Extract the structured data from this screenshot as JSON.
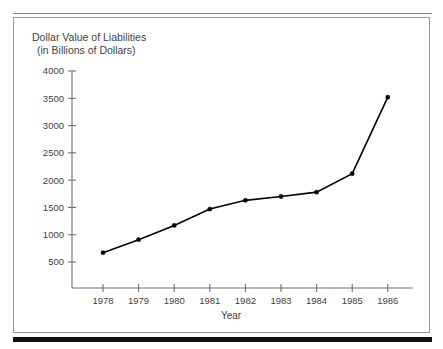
{
  "figure": {
    "background_color": "#ffffff",
    "frame_color": "#9a9a9a",
    "rule_color": "#8a8a8a",
    "bottom_bar_color": "#111111",
    "title_line1": "Dollar Value of Liabilities",
    "title_line2": "(in Billions of Dollars)"
  },
  "chart_data": {
    "type": "line",
    "title": "Dollar Value of Liabilities (in Billions of Dollars)",
    "title_lines": [
      "Dollar Value of Liabilities",
      "(in Billions of Dollars)"
    ],
    "xlabel": "Year",
    "ylabel": "Dollar Value of Liabilities (in Billions of Dollars)",
    "categories": [
      "1978",
      "1979",
      "1980",
      "1981",
      "1982",
      "1983",
      "1984",
      "1985",
      "1986"
    ],
    "x": [
      1978,
      1979,
      1980,
      1981,
      1982,
      1983,
      1984,
      1985,
      1986
    ],
    "values": [
      670,
      910,
      1170,
      1470,
      1630,
      1700,
      1780,
      2120,
      3520
    ],
    "series": [
      {
        "name": "Dollar Value of Liabilities",
        "color": "#000000",
        "marker": "filled-square",
        "values": [
          670,
          910,
          1170,
          1470,
          1630,
          1700,
          1780,
          2120,
          3520
        ]
      }
    ],
    "yticks": [
      500,
      1000,
      1500,
      2000,
      2500,
      3000,
      3500,
      4000
    ],
    "ytick_labels": [
      "500",
      "1000",
      "1500",
      "2000",
      "2500",
      "3000",
      "3500",
      "4000"
    ],
    "xtick_labels": [
      "1978",
      "1979",
      "1980",
      "1981",
      "1982",
      "1983",
      "1984",
      "1985",
      "1986"
    ],
    "ylim": [
      0,
      4000
    ],
    "xlim": [
      1977.4,
      1986.9
    ],
    "grid": false,
    "legend": false,
    "legend_position": "none",
    "line_color": "#000000",
    "axis_color": "#6f6f6f"
  }
}
